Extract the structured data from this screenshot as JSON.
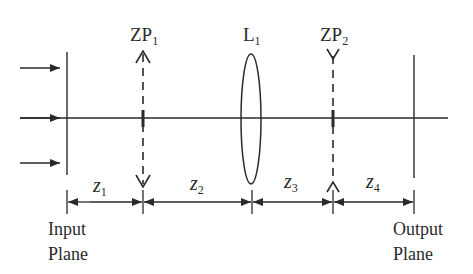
{
  "diagram": {
    "type": "optical-system-schematic",
    "components": {
      "zp1": {
        "label": "ZP",
        "subscript": "1"
      },
      "l1": {
        "label": "L",
        "subscript": "1"
      },
      "zp2": {
        "label": "ZP",
        "subscript": "2"
      }
    },
    "distances": [
      {
        "label": "z",
        "subscript": "1"
      },
      {
        "label": "z",
        "subscript": "2"
      },
      {
        "label": "z",
        "subscript": "3"
      },
      {
        "label": "z",
        "subscript": "4"
      }
    ],
    "planes": {
      "input": {
        "line1": "Input",
        "line2": "Plane"
      },
      "output": {
        "line1": "Output",
        "line2": "Plane"
      }
    },
    "colors": {
      "stroke": "#2a2a2a",
      "background": "#ffffff"
    }
  }
}
